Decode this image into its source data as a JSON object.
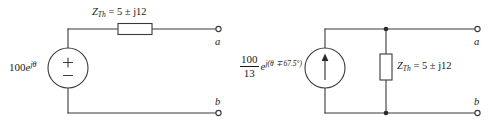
{
  "figure": {
    "caption": "",
    "stroke_color": "#3a3a3a",
    "background_color": "#ffffff"
  },
  "left_circuit": {
    "name": "thevenin-equivalent",
    "source": {
      "type": "voltage-source",
      "label_mantissa": "100",
      "label_exponent_e": "e",
      "label_exponent_arg": "jθ",
      "plus_symbol": "+",
      "minus_symbol": "−"
    },
    "impedance": {
      "type": "series-impedance-box",
      "symbol": "Z",
      "subscript": "Th",
      "equals": "=",
      "value": "5 ± j12",
      "full_label": "Z_Th = 5 ± j12"
    },
    "terminals": [
      {
        "label": "a",
        "position": "top-right"
      },
      {
        "label": "b",
        "position": "bottom-right"
      }
    ]
  },
  "right_circuit": {
    "name": "norton-equivalent",
    "source": {
      "type": "current-source",
      "numerator": "100",
      "denominator": "13",
      "exponent_e": "e",
      "exponent_arg": "j(θ ∓ 67.5°)",
      "arrow_direction": "up",
      "full_label": "(100/13) e^{j(θ ∓ 67.5°)}"
    },
    "impedance": {
      "type": "shunt-impedance-box",
      "symbol": "Z",
      "subscript": "Th",
      "equals": "=",
      "value": "5 ± j12",
      "full_label": "Z_Th = 5 ± j12"
    },
    "terminals": [
      {
        "label": "a",
        "position": "top-right"
      },
      {
        "label": "b",
        "position": "bottom-right"
      }
    ]
  }
}
